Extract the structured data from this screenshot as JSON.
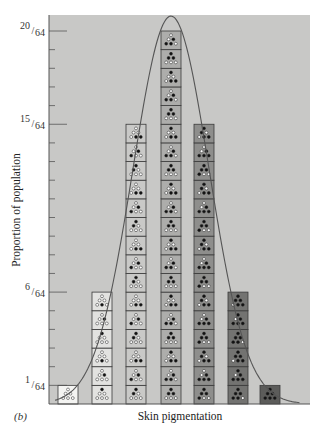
{
  "panel_label": "(b)",
  "chart_data": {
    "type": "bar",
    "title": "",
    "xlabel": "Skin pigmentation",
    "ylabel": "Proportion of population",
    "categories": [
      "0 dark alleles",
      "1 dark allele",
      "2 dark alleles",
      "3 dark alleles",
      "4 dark alleles",
      "5 dark alleles",
      "6 dark alleles"
    ],
    "values": [
      1,
      6,
      15,
      20,
      15,
      6,
      1
    ],
    "values_as_fraction": [
      "1/64",
      "6/64",
      "15/64",
      "20/64",
      "15/64",
      "6/64",
      "1/64"
    ],
    "denominator": 64,
    "ylim": [
      0,
      21
    ],
    "y_ticks": [
      {
        "value": 1,
        "label_num": "1",
        "label_den": "64",
        "major": true
      },
      {
        "value": 6,
        "label_num": "6",
        "label_den": "64",
        "major": true
      },
      {
        "value": 15,
        "label_num": "15",
        "label_den": "64",
        "major": true
      },
      {
        "value": 20,
        "label_num": "20",
        "label_den": "64",
        "major": true
      }
    ],
    "overlay_curve": "normal distribution fitted over columns",
    "grid": false,
    "legend": null,
    "box_description": "Each box shows a genotype as 6 dots (3 gene pairs); filled dots = dark alleles, open dots = light alleles",
    "column_colors": [
      "#f4f4f2",
      "#e2e2e0",
      "#c9c9c7",
      "#adadab",
      "#8e8e8c",
      "#737371",
      "#5c5c5a"
    ]
  },
  "colors": {
    "background": "#c8c8c6",
    "frame": "#555555",
    "curve": "#555555"
  }
}
